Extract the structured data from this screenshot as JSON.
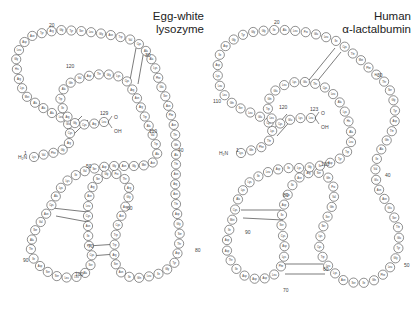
{
  "panels": [
    {
      "id": "lysozyme",
      "title_line1": "Egg-white",
      "title_line2": "lysozyme",
      "n_terminus": "H₂N",
      "c_terminus_o": "O",
      "c_terminus_oh": "OH",
      "residue_labels": [
        "Lys",
        "Val",
        "Phe",
        "Gly",
        "Arg",
        "Cys",
        "Glu",
        "Leu",
        "Ala",
        "Ala",
        "Ala",
        "Met",
        "Lys",
        "Arg",
        "His",
        "Gly",
        "Leu",
        "Asp",
        "Asn",
        "Tyr",
        "Arg",
        "Gly",
        "Tyr",
        "Ser",
        "Leu",
        "Gly",
        "Asn",
        "Trp",
        "Val",
        "Cys",
        "Ala",
        "Ala",
        "Lys",
        "Phe",
        "Glu",
        "Ser",
        "Asn",
        "Phe",
        "Asn",
        "Thr",
        "Gln",
        "Ala",
        "Thr",
        "Asn",
        "Arg",
        "Asn",
        "Thr",
        "Asp",
        "Gly",
        "Ser",
        "Thr",
        "Asp",
        "Tyr",
        "Gly",
        "Ile",
        "Leu",
        "Gln",
        "Ile",
        "Asn",
        "Ser",
        "Arg",
        "Trp",
        "Trp",
        "Cys",
        "Asn",
        "Asp",
        "Gly",
        "Arg",
        "Thr",
        "Pro",
        "Gly",
        "Ser",
        "Arg",
        "Asn",
        "Leu",
        "Cys",
        "Asn",
        "Ile",
        "Pro",
        "Cys",
        "Ser",
        "Ala",
        "Leu",
        "Leu",
        "Ser",
        "Ser",
        "Asp",
        "Ile",
        "Thr",
        "Ala",
        "Ser",
        "Val",
        "Asn",
        "Cys",
        "Ala",
        "Lys",
        "Lys",
        "Ile",
        "Val",
        "Ser",
        "Asp",
        "Gly",
        "Asn",
        "Gly",
        "Met",
        "Asn",
        "Ala",
        "Trp",
        "Val",
        "Ala",
        "Trp",
        "Arg",
        "Asn",
        "Arg",
        "Cys",
        "Lys",
        "Gly",
        "Thr",
        "Asp",
        "Val",
        "Gln",
        "Ala",
        "Trp",
        "Ile",
        "Arg",
        "Gly",
        "Cys",
        "Arg",
        "Leu"
      ],
      "position_numbers": [
        {
          "label": "1",
          "x": 24,
          "y": 150
        },
        {
          "label": "20",
          "x": 49,
          "y": 22
        },
        {
          "label": "30",
          "x": 145,
          "y": 52
        },
        {
          "label": "40",
          "x": 178,
          "y": 147
        },
        {
          "label": "50",
          "x": 86,
          "y": 163
        },
        {
          "label": "60",
          "x": 127,
          "y": 205
        },
        {
          "label": "70",
          "x": 88,
          "y": 243
        },
        {
          "label": "80",
          "x": 195,
          "y": 247
        },
        {
          "label": "90",
          "x": 23,
          "y": 257
        },
        {
          "label": "100",
          "x": 75,
          "y": 271
        },
        {
          "label": "110",
          "x": 149,
          "y": 128
        },
        {
          "label": "120",
          "x": 66,
          "y": 63
        },
        {
          "label": "129",
          "x": 100,
          "y": 110
        }
      ]
    },
    {
      "id": "alpha-lactalbumin",
      "title_line1": "Human",
      "title_line2": "α-lactalbumin",
      "n_terminus": "H₂N",
      "c_terminus_o": "O",
      "c_terminus_oh": "OH",
      "residue_labels": [
        "Lys",
        "Gln",
        "Phe",
        "Thr",
        "Lys",
        "Cys",
        "Glu",
        "Leu",
        "Ser",
        "Gln",
        "Leu",
        "Leu",
        "Lys",
        "Asp",
        "Ile",
        "Asp",
        "Gly",
        "Tyr",
        "Gly",
        "Gly",
        "Ile",
        "Ala",
        "Leu",
        "Pro",
        "Glu",
        "Leu",
        "Ile",
        "Cys",
        "Thr",
        "Met",
        "Phe",
        "His",
        "Thr",
        "Ser",
        "Gly",
        "Tyr",
        "Asp",
        "Thr",
        "Gln",
        "Ala",
        "Ile",
        "Val",
        "Glu",
        "Asn",
        "Asn",
        "Glu",
        "Ser",
        "Thr",
        "Glu",
        "Tyr",
        "Gly",
        "Leu",
        "Phe",
        "Gln",
        "Ile",
        "Ser",
        "Asn",
        "Lys",
        "Leu",
        "Trp",
        "Cys",
        "Lys",
        "Ser",
        "Ser",
        "Gln",
        "Val",
        "Pro",
        "Gln",
        "Ser",
        "Arg",
        "Asn",
        "Ile",
        "Cys",
        "Asp",
        "Ile",
        "Ser",
        "Cys",
        "Asp",
        "Lys",
        "Phe",
        "Leu",
        "Asp",
        "Asp",
        "Asp",
        "Ile",
        "Thr",
        "Asp",
        "Asp",
        "Ile",
        "Met",
        "Cys",
        "Ala",
        "Lys",
        "Lys",
        "Ile",
        "Leu",
        "Asp",
        "Ile",
        "Lys",
        "Gly",
        "Ile",
        "Asp",
        "Tyr",
        "Trp",
        "Leu",
        "Ala",
        "His",
        "Lys",
        "Ala",
        "Leu",
        "Cys",
        "Thr",
        "Glu",
        "Lys",
        "Leu",
        "Glu",
        "Gln",
        "Trp",
        "Leu",
        "Cys",
        "Glu",
        "Lys",
        "Leu"
      ],
      "position_numbers": [
        {
          "label": "1",
          "x": 29,
          "y": 147
        },
        {
          "label": "20",
          "x": 67,
          "y": 19
        },
        {
          "label": "30",
          "x": 170,
          "y": 72
        },
        {
          "label": "40",
          "x": 178,
          "y": 172
        },
        {
          "label": "50",
          "x": 197,
          "y": 262
        },
        {
          "label": "60",
          "x": 116,
          "y": 266
        },
        {
          "label": "70",
          "x": 76,
          "y": 287
        },
        {
          "label": "80",
          "x": 76,
          "y": 192
        },
        {
          "label": "90",
          "x": 38,
          "y": 229
        },
        {
          "label": "100",
          "x": 114,
          "y": 161
        },
        {
          "label": "110",
          "x": 6,
          "y": 98
        },
        {
          "label": "120",
          "x": 72,
          "y": 104
        },
        {
          "label": "123",
          "x": 103,
          "y": 106
        }
      ]
    }
  ],
  "chain_paths": {
    "lysozyme": [
      [
        34,
        157
      ],
      [
        46,
        154
      ],
      [
        58,
        152
      ],
      [
        68,
        147
      ],
      [
        70,
        138
      ],
      [
        70,
        126
      ],
      [
        62,
        118
      ],
      [
        50,
        112
      ],
      [
        38,
        105
      ],
      [
        26,
        96
      ],
      [
        20,
        84
      ],
      [
        17,
        70
      ],
      [
        16,
        56
      ],
      [
        22,
        44
      ],
      [
        32,
        36
      ],
      [
        46,
        32
      ],
      [
        62,
        30
      ],
      [
        80,
        31
      ],
      [
        98,
        33
      ],
      [
        116,
        36
      ],
      [
        132,
        40
      ],
      [
        142,
        46
      ],
      [
        150,
        56
      ],
      [
        156,
        70
      ],
      [
        160,
        84
      ],
      [
        166,
        98
      ],
      [
        170,
        112
      ],
      [
        174,
        126
      ],
      [
        176,
        140
      ],
      [
        176,
        156
      ],
      [
        176,
        172
      ],
      [
        175,
        188
      ],
      [
        176,
        204
      ],
      [
        178,
        220
      ],
      [
        180,
        236
      ],
      [
        178,
        252
      ],
      [
        174,
        264
      ],
      [
        164,
        272
      ],
      [
        152,
        276
      ],
      [
        138,
        278
      ],
      [
        124,
        276
      ],
      [
        116,
        266
      ],
      [
        114,
        252
      ],
      [
        115,
        238
      ],
      [
        118,
        224
      ],
      [
        123,
        212
      ],
      [
        128,
        200
      ],
      [
        130,
        190
      ],
      [
        126,
        180
      ],
      [
        118,
        174
      ],
      [
        106,
        174
      ],
      [
        96,
        180
      ],
      [
        90,
        192
      ],
      [
        88,
        206
      ],
      [
        88,
        220
      ],
      [
        88,
        234
      ],
      [
        89,
        246
      ],
      [
        92,
        256
      ],
      [
        90,
        268
      ],
      [
        82,
        276
      ],
      [
        70,
        278
      ],
      [
        56,
        276
      ],
      [
        44,
        270
      ],
      [
        34,
        260
      ],
      [
        30,
        246
      ],
      [
        34,
        232
      ],
      [
        42,
        220
      ],
      [
        50,
        208
      ],
      [
        56,
        196
      ],
      [
        62,
        186
      ],
      [
        70,
        178
      ],
      [
        82,
        172
      ],
      [
        96,
        168
      ],
      [
        110,
        166
      ],
      [
        126,
        166
      ],
      [
        140,
        166
      ],
      [
        152,
        164
      ],
      [
        158,
        152
      ],
      [
        154,
        138
      ],
      [
        148,
        124
      ],
      [
        142,
        110
      ],
      [
        136,
        96
      ],
      [
        128,
        82
      ],
      [
        116,
        75
      ],
      [
        102,
        74
      ],
      [
        88,
        76
      ],
      [
        74,
        80
      ],
      [
        64,
        88
      ],
      [
        60,
        100
      ],
      [
        64,
        112
      ],
      [
        70,
        120
      ],
      [
        78,
        125
      ],
      [
        92,
        124
      ],
      [
        104,
        122
      ]
    ],
    "alpha-lactalbumin": [
      [
        34,
        153
      ],
      [
        46,
        150
      ],
      [
        58,
        146
      ],
      [
        64,
        138
      ],
      [
        66,
        126
      ],
      [
        56,
        118
      ],
      [
        42,
        112
      ],
      [
        28,
        106
      ],
      [
        18,
        96
      ],
      [
        12,
        84
      ],
      [
        10,
        70
      ],
      [
        12,
        56
      ],
      [
        20,
        44
      ],
      [
        32,
        36
      ],
      [
        46,
        32
      ],
      [
        62,
        30
      ],
      [
        80,
        30
      ],
      [
        98,
        32
      ],
      [
        116,
        36
      ],
      [
        132,
        42
      ],
      [
        144,
        52
      ],
      [
        156,
        62
      ],
      [
        166,
        72
      ],
      [
        176,
        80
      ],
      [
        184,
        92
      ],
      [
        188,
        106
      ],
      [
        188,
        120
      ],
      [
        184,
        134
      ],
      [
        176,
        146
      ],
      [
        170,
        158
      ],
      [
        168,
        172
      ],
      [
        170,
        186
      ],
      [
        178,
        200
      ],
      [
        186,
        214
      ],
      [
        192,
        230
      ],
      [
        192,
        246
      ],
      [
        188,
        260
      ],
      [
        180,
        272
      ],
      [
        168,
        280
      ],
      [
        152,
        284
      ],
      [
        136,
        280
      ],
      [
        124,
        270
      ],
      [
        116,
        258
      ],
      [
        112,
        246
      ],
      [
        114,
        232
      ],
      [
        120,
        218
      ],
      [
        126,
        204
      ],
      [
        128,
        190
      ],
      [
        122,
        178
      ],
      [
        110,
        172
      ],
      [
        96,
        174
      ],
      [
        86,
        184
      ],
      [
        80,
        196
      ],
      [
        76,
        208
      ],
      [
        74,
        222
      ],
      [
        76,
        236
      ],
      [
        78,
        250
      ],
      [
        76,
        264
      ],
      [
        66,
        276
      ],
      [
        52,
        280
      ],
      [
        38,
        276
      ],
      [
        26,
        266
      ],
      [
        20,
        252
      ],
      [
        20,
        238
      ],
      [
        24,
        224
      ],
      [
        28,
        210
      ],
      [
        32,
        196
      ],
      [
        40,
        184
      ],
      [
        52,
        176
      ],
      [
        66,
        170
      ],
      [
        82,
        168
      ],
      [
        98,
        168
      ],
      [
        112,
        166
      ],
      [
        126,
        162
      ],
      [
        138,
        156
      ],
      [
        144,
        144
      ],
      [
        144,
        130
      ],
      [
        140,
        116
      ],
      [
        134,
        104
      ],
      [
        126,
        94
      ],
      [
        116,
        86
      ],
      [
        102,
        82
      ],
      [
        88,
        82
      ],
      [
        74,
        86
      ],
      [
        64,
        94
      ],
      [
        60,
        106
      ],
      [
        64,
        118
      ],
      [
        72,
        124
      ],
      [
        82,
        120
      ],
      [
        94,
        118
      ],
      [
        104,
        118
      ]
    ]
  },
  "disulfide_bridges": {
    "lysozyme": [
      [
        [
          136,
          48
        ],
        [
          130,
          80
        ]
      ],
      [
        [
          144,
          50
        ],
        [
          138,
          84
        ]
      ],
      [
        [
          66,
          132
        ],
        [
          82,
          116
        ]
      ],
      [
        [
          72,
          136
        ],
        [
          88,
          120
        ]
      ],
      [
        [
          52,
          208
        ],
        [
          88,
          212
        ]
      ],
      [
        [
          56,
          216
        ],
        [
          88,
          222
        ]
      ],
      [
        [
          88,
          246
        ],
        [
          118,
          244
        ]
      ],
      [
        [
          90,
          256
        ],
        [
          116,
          254
        ]
      ]
    ],
    "alpha-lactalbumin": [
      [
        [
          128,
          48
        ],
        [
          102,
          80
        ]
      ],
      [
        [
          134,
          52
        ],
        [
          108,
          84
        ]
      ],
      [
        [
          64,
          132
        ],
        [
          80,
          114
        ]
      ],
      [
        [
          70,
          136
        ],
        [
          86,
          118
        ]
      ],
      [
        [
          34,
          210
        ],
        [
          74,
          210
        ]
      ],
      [
        [
          36,
          218
        ],
        [
          76,
          220
        ]
      ],
      [
        [
          76,
          264
        ],
        [
          116,
          264
        ]
      ],
      [
        [
          78,
          274
        ],
        [
          118,
          274
        ]
      ]
    ]
  },
  "colors": {
    "line": "#444444",
    "circle_fill": "#ffffff",
    "text": "#333333",
    "background": "#ffffff"
  }
}
